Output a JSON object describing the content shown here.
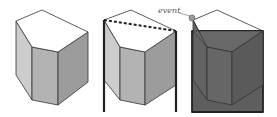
{
  "figure": {
    "panels": [
      {
        "id": "prism-plain",
        "description": "pentagonal prism"
      },
      {
        "id": "prism-with-walls",
        "description": "prism with vertical walls and dashed line"
      },
      {
        "id": "prism-shaded",
        "description": "prism inside shaded box with event point"
      }
    ],
    "annotation": {
      "label": "event"
    },
    "colors": {
      "top_face": "#ffffff",
      "left_face": "#cdcdcd",
      "front_face": "#b3b3b3",
      "right_face": "#9c9c9c",
      "shaded_box": "#5e5e5e",
      "shaded_front": "#666666",
      "shaded_right": "#5a5a5a",
      "edge": "#333333",
      "event_point": "#999999"
    }
  }
}
